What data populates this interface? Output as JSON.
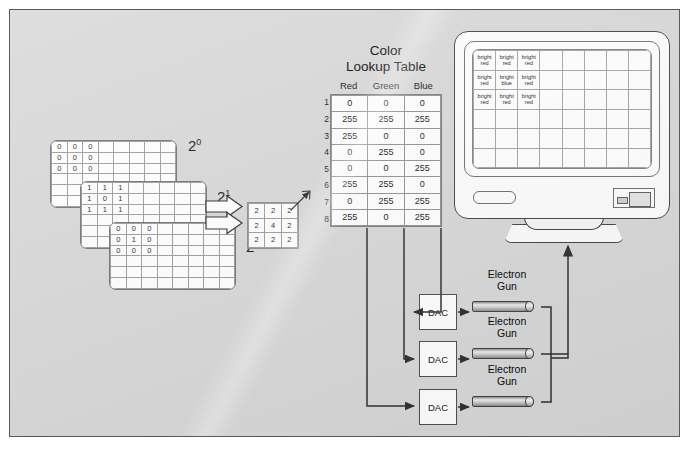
{
  "bitplanes": [
    {
      "label_base": "2",
      "label_exp": "0",
      "name": "bitplane-2-0",
      "values": [
        [
          "0",
          "0",
          "0",
          "",
          "",
          "",
          "",
          ""
        ],
        [
          "0",
          "0",
          "0",
          "",
          "",
          "",
          "",
          ""
        ],
        [
          "0",
          "0",
          "0",
          "",
          "",
          "",
          "",
          ""
        ],
        [
          "",
          "",
          "",
          "",
          "",
          "",
          "",
          ""
        ],
        [
          "",
          "",
          "",
          "",
          "",
          "",
          "",
          ""
        ],
        [
          "",
          "",
          "",
          "",
          "",
          "",
          "",
          ""
        ]
      ]
    },
    {
      "label_base": "2",
      "label_exp": "1",
      "name": "bitplane-2-1",
      "values": [
        [
          "1",
          "1",
          "1",
          "",
          "",
          "",
          "",
          ""
        ],
        [
          "1",
          "0",
          "1",
          "",
          "",
          "",
          "",
          ""
        ],
        [
          "1",
          "1",
          "1",
          "",
          "",
          "",
          "",
          ""
        ],
        [
          "",
          "",
          "",
          "",
          "",
          "",
          "",
          ""
        ],
        [
          "",
          "",
          "",
          "",
          "",
          "",
          "",
          ""
        ],
        [
          "",
          "",
          "",
          "",
          "",
          "",
          "",
          ""
        ]
      ]
    },
    {
      "label_base": "2",
      "label_exp": "2",
      "name": "bitplane-2-2",
      "values": [
        [
          "0",
          "0",
          "0",
          "",
          "",
          "",
          "",
          ""
        ],
        [
          "0",
          "1",
          "0",
          "",
          "",
          "",
          "",
          ""
        ],
        [
          "0",
          "0",
          "0",
          "",
          "",
          "",
          "",
          ""
        ],
        [
          "",
          "",
          "",
          "",
          "",
          "",
          "",
          ""
        ],
        [
          "",
          "",
          "",
          "",
          "",
          "",
          "",
          ""
        ],
        [
          "",
          "",
          "",
          "",
          "",
          "",
          "",
          ""
        ]
      ]
    }
  ],
  "index_matrix": {
    "name": "pixel-index-matrix",
    "values": [
      [
        "2",
        "2",
        "2"
      ],
      [
        "2",
        "4",
        "2"
      ],
      [
        "2",
        "2",
        "2"
      ]
    ]
  },
  "clut": {
    "title_line1": "Color",
    "title_line2": "Lookup Table",
    "columns": [
      "Red",
      "Green",
      "Blue"
    ],
    "row_numbers": [
      "1",
      "2",
      "3",
      "4",
      "5",
      "6",
      "7",
      "8"
    ],
    "rows": [
      [
        "0",
        "0",
        "0"
      ],
      [
        "255",
        "255",
        "255"
      ],
      [
        "255",
        "0",
        "0"
      ],
      [
        "0",
        "255",
        "0"
      ],
      [
        "0",
        "0",
        "255"
      ],
      [
        "255",
        "255",
        "0"
      ],
      [
        "0",
        "255",
        "255"
      ],
      [
        "255",
        "0",
        "255"
      ]
    ]
  },
  "dacs": [
    {
      "label": "DAC",
      "name": "dac-red"
    },
    {
      "label": "DAC",
      "name": "dac-green"
    },
    {
      "label": "DAC",
      "name": "dac-blue"
    }
  ],
  "electron_guns": [
    {
      "line1": "Electron",
      "line2": "Gun",
      "name": "electron-gun-red"
    },
    {
      "line1": "Electron",
      "line2": "Gun",
      "name": "electron-gun-green"
    },
    {
      "line1": "Electron",
      "line2": "Gun",
      "name": "electron-gun-blue"
    }
  ],
  "monitor": {
    "name": "crt-monitor",
    "screen": [
      [
        "bright red",
        "bright red",
        "bright red",
        "",
        "",
        "",
        "",
        ""
      ],
      [
        "bright red",
        "bright blue",
        "bright red",
        "",
        "",
        "",
        "",
        ""
      ],
      [
        "bright red",
        "bright red",
        "bright red",
        "",
        "",
        "",
        "",
        ""
      ],
      [
        "",
        "",
        "",
        "",
        "",
        "",
        "",
        ""
      ],
      [
        "",
        "",
        "",
        "",
        "",
        "",
        "",
        ""
      ],
      [
        "",
        "",
        "",
        "",
        "",
        "",
        "",
        ""
      ]
    ]
  },
  "colors": {
    "panel_background": "#d7d7d7",
    "page_background": "#ffffff",
    "line": "#2b2b2b",
    "cell_border": "#9a9a9a"
  }
}
